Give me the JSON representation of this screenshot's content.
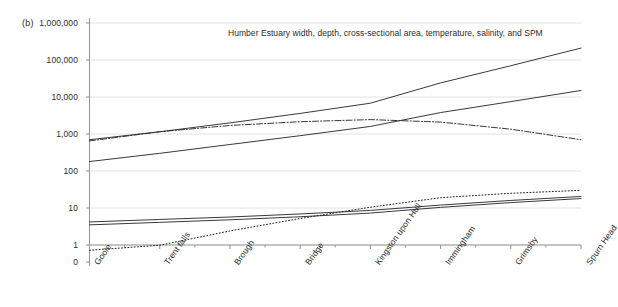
{
  "panel": {
    "label": "(b)"
  },
  "chart_data": {
    "type": "line",
    "title": "Humber Estuary width, depth, cross-sectional area, temperature, salinity, and SPM",
    "xlabel": "",
    "ylabel": "",
    "yscale": "log",
    "ylim": [
      1,
      1000000
    ],
    "grid": true,
    "legend_position": "none",
    "categories": [
      "Goole",
      "Trent falls",
      "Brough",
      "Bridge",
      "Kingston upon Hull",
      "Immingham",
      "Grimsby",
      "Spurn Head"
    ],
    "ytick_labels": [
      "0",
      "1",
      "10",
      "100",
      "1,000",
      "10,000",
      "100,000",
      "1,000,000"
    ],
    "ytick_values": [
      0,
      1,
      10,
      100,
      1000,
      10000,
      100000,
      1000000
    ],
    "series": [
      {
        "name": "Cross-sectional area",
        "style": "solid",
        "values": [
          700,
          1150,
          2000,
          3600,
          6800,
          24000,
          70000,
          210000
        ]
      },
      {
        "name": "Width",
        "style": "solid",
        "values": [
          180,
          300,
          520,
          900,
          1600,
          3800,
          7500,
          15000
        ]
      },
      {
        "name": "SPM",
        "style": "dash-dot",
        "values": [
          650,
          1150,
          1700,
          2150,
          2450,
          2100,
          1350,
          700
        ]
      },
      {
        "name": "Depth",
        "style": "solid",
        "values": [
          4.2,
          4.9,
          5.7,
          6.9,
          8.6,
          12.0,
          16.0,
          20.5
        ]
      },
      {
        "name": "Temperature",
        "style": "solid",
        "values": [
          3.5,
          4.1,
          4.8,
          5.8,
          7.3,
          10.4,
          14.0,
          18.0
        ]
      },
      {
        "name": "Salinity",
        "style": "dotted",
        "values": [
          0.32,
          0.95,
          2.4,
          5.2,
          10.5,
          19.0,
          25.0,
          30.0
        ]
      }
    ]
  },
  "colors": {
    "line": "#222222",
    "grid": "#e2e2e2",
    "axis": "#999999",
    "text": "#2b2b2b"
  }
}
